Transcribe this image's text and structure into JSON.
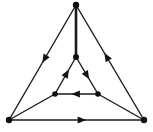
{
  "diagram": {
    "type": "directed-graph",
    "background_color": "#ffffff",
    "stroke_color": "#1a1a1a",
    "vertex_color": "#111111",
    "arrow_color": "#121212",
    "canvas": {
      "width": 153,
      "height": 132
    },
    "vertices": [
      {
        "id": "outer-top",
        "label": "",
        "x": 76,
        "y": 5,
        "r": 3.2,
        "group": "outer"
      },
      {
        "id": "outer-bottom-left",
        "label": "",
        "x": 9,
        "y": 120,
        "r": 3.2,
        "group": "outer"
      },
      {
        "id": "outer-bottom-right",
        "label": "",
        "x": 144,
        "y": 120,
        "r": 3.2,
        "group": "outer"
      },
      {
        "id": "inner-top",
        "label": "",
        "x": 76,
        "y": 57,
        "r": 3.0,
        "group": "inner"
      },
      {
        "id": "inner-bottom-left",
        "label": "",
        "x": 55,
        "y": 94,
        "r": 2.8,
        "group": "inner"
      },
      {
        "id": "inner-bottom-right",
        "label": "",
        "x": 98,
        "y": 94,
        "r": 2.8,
        "group": "inner"
      }
    ],
    "edges": [
      {
        "id": "outer-left-edge",
        "from": "outer-top",
        "to": "outer-bottom-left",
        "class": "outer",
        "directed": true,
        "arrow_position": 0.47,
        "arrow_direction": "down-left",
        "x1": 76,
        "y1": 5,
        "x2": 9,
        "y2": 120
      },
      {
        "id": "outer-bottom-edge",
        "from": "outer-bottom-left",
        "to": "outer-bottom-right",
        "class": "outer",
        "directed": true,
        "arrow_position": 0.54,
        "arrow_direction": "right",
        "x1": 9,
        "y1": 120,
        "x2": 144,
        "y2": 120
      },
      {
        "id": "outer-right-edge",
        "from": "outer-bottom-right",
        "to": "outer-top",
        "class": "outer",
        "directed": true,
        "arrow_position": 0.55,
        "arrow_direction": "up-right",
        "x1": 144,
        "y1": 120,
        "x2": 76,
        "y2": 5
      },
      {
        "id": "inner-left-edge",
        "from": "inner-bottom-left",
        "to": "inner-top",
        "class": "inner",
        "directed": true,
        "arrow_position": 0.56,
        "arrow_direction": "up-right",
        "x1": 55,
        "y1": 94,
        "x2": 76,
        "y2": 57
      },
      {
        "id": "inner-right-edge",
        "from": "inner-top",
        "to": "inner-bottom-right",
        "class": "inner",
        "directed": true,
        "arrow_position": 0.5,
        "arrow_direction": "down-right",
        "x1": 76,
        "y1": 57,
        "x2": 98,
        "y2": 94
      },
      {
        "id": "inner-bottom-edge",
        "from": "inner-bottom-right",
        "to": "inner-bottom-left",
        "class": "inner",
        "directed": true,
        "arrow_position": 0.52,
        "arrow_direction": "left",
        "x1": 98,
        "y1": 94,
        "x2": 55,
        "y2": 94
      },
      {
        "id": "spoke-top",
        "from": "outer-top",
        "to": "inner-top",
        "class": "spoke-vertical",
        "directed": false,
        "x1": 76,
        "y1": 5,
        "x2": 76,
        "y2": 57
      },
      {
        "id": "spoke-bottom-left",
        "from": "outer-bottom-left",
        "to": "inner-bottom-left",
        "class": "spoke",
        "directed": false,
        "x1": 9,
        "y1": 120,
        "x2": 55,
        "y2": 94
      },
      {
        "id": "spoke-bottom-right",
        "from": "outer-bottom-right",
        "to": "inner-bottom-right",
        "class": "spoke",
        "directed": false,
        "x1": 144,
        "y1": 120,
        "x2": 98,
        "y2": 94
      }
    ],
    "counts": {
      "vertices": 6,
      "edges": 9,
      "directed_edges": 6,
      "undirected_edges": 3
    }
  }
}
